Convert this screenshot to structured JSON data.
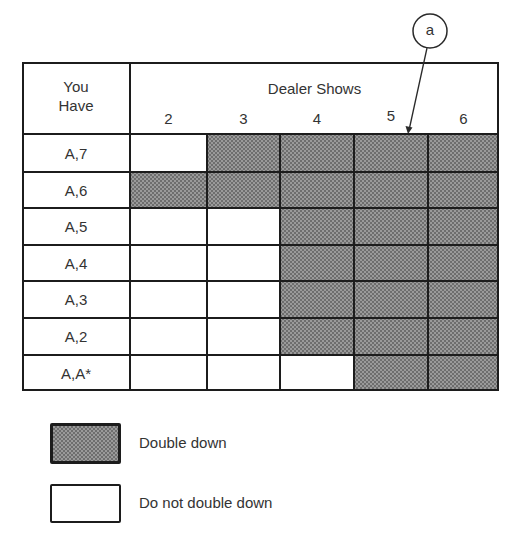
{
  "header": {
    "row_header_line1": "You",
    "row_header_line2": "Have",
    "column_group_title": "Dealer Shows"
  },
  "callout": {
    "label": "a"
  },
  "legend": {
    "items": [
      {
        "label": "Double down",
        "shaded": true
      },
      {
        "label": "Do not double down",
        "shaded": false
      }
    ]
  },
  "chart_data": {
    "type": "table",
    "row_axis_label": "You Have",
    "column_axis_label": "Dealer Shows",
    "columns": [
      "2",
      "3",
      "4",
      "5",
      "6"
    ],
    "rows": [
      {
        "hand": "A,7",
        "double_down": [
          false,
          true,
          true,
          true,
          true
        ]
      },
      {
        "hand": "A,6",
        "double_down": [
          true,
          true,
          true,
          true,
          true
        ]
      },
      {
        "hand": "A,5",
        "double_down": [
          false,
          false,
          true,
          true,
          true
        ]
      },
      {
        "hand": "A,4",
        "double_down": [
          false,
          false,
          true,
          true,
          true
        ]
      },
      {
        "hand": "A,3",
        "double_down": [
          false,
          false,
          true,
          true,
          true
        ]
      },
      {
        "hand": "A,2",
        "double_down": [
          false,
          false,
          true,
          true,
          true
        ]
      },
      {
        "hand": "A,A*",
        "double_down": [
          false,
          false,
          false,
          true,
          true
        ]
      }
    ],
    "legend": {
      "shaded": "Double down",
      "white": "Do not double down"
    },
    "annotations": [
      {
        "label": "a",
        "points_to": "top edge of column 5, row A,7"
      }
    ]
  }
}
